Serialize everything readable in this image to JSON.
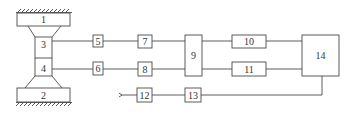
{
  "diagram": {
    "type": "block-diagram",
    "colors": {
      "stroke": "#4a4a4a",
      "background": "#ffffff"
    },
    "blocks": [
      {
        "id": "1",
        "label": "1"
      },
      {
        "id": "2",
        "label": "2"
      },
      {
        "id": "3",
        "label": "3"
      },
      {
        "id": "4",
        "label": "4"
      },
      {
        "id": "5",
        "label": "5"
      },
      {
        "id": "6",
        "label": "6"
      },
      {
        "id": "7",
        "label": "7"
      },
      {
        "id": "8",
        "label": "8"
      },
      {
        "id": "9",
        "label": "9"
      },
      {
        "id": "10",
        "label": "10"
      },
      {
        "id": "11",
        "label": "11"
      },
      {
        "id": "12",
        "label": "12"
      },
      {
        "id": "13",
        "label": "13"
      },
      {
        "id": "14",
        "label": "14"
      }
    ],
    "connections": [
      [
        "3",
        "5"
      ],
      [
        "5",
        "7"
      ],
      [
        "7",
        "9"
      ],
      [
        "9",
        "10"
      ],
      [
        "10",
        "14"
      ],
      [
        "4",
        "6"
      ],
      [
        "6",
        "8"
      ],
      [
        "8",
        "9"
      ],
      [
        "9",
        "11"
      ],
      [
        "11",
        "14"
      ],
      [
        "input",
        "12"
      ],
      [
        "12",
        "13"
      ],
      [
        "13",
        "14"
      ]
    ]
  }
}
